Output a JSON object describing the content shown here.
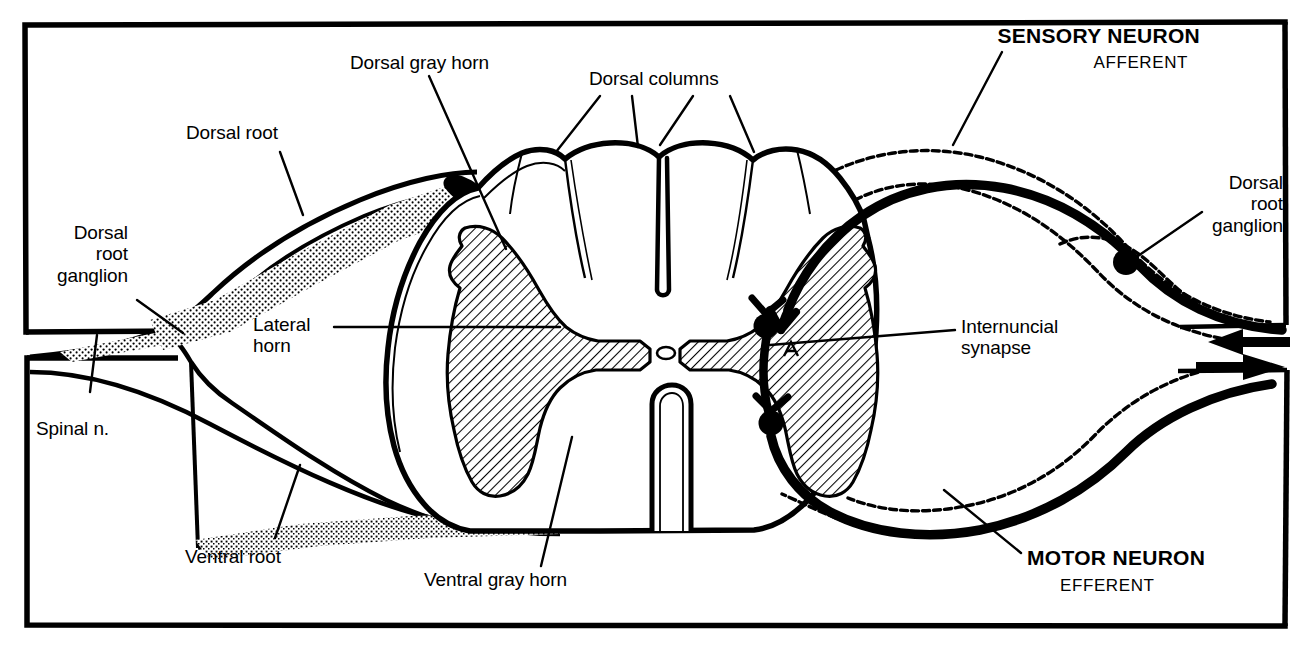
{
  "figure": {
    "ink_color": "#000000",
    "background_color": "#ffffff"
  },
  "labels": {
    "dorsal_root_ganglion_left": "Dorsal\nroot\nganglion",
    "dorsal_root": "Dorsal root",
    "dorsal_gray_horn": "Dorsal gray horn",
    "dorsal_columns": "Dorsal columns",
    "sensory_neuron": "SENSORY NEURON",
    "afferent": "AFFERENT",
    "dorsal_root_ganglion_right": "Dorsal\nroot\nganglion",
    "lateral_horn": "Lateral\nhorn",
    "internuncial_synapse": "Internuncial\nsynapse",
    "spinal_nerve": "Spinal n.",
    "ventral_root": "Ventral root",
    "ventral_gray_horn": "Ventral gray horn",
    "motor_neuron": "MOTOR NEURON",
    "efferent": "EFFERENT"
  },
  "structures": [
    {
      "name": "dorsal-root-ganglion-left",
      "side": "left",
      "type": "ganglion"
    },
    {
      "name": "dorsal-root",
      "side": "left",
      "type": "nerve-root"
    },
    {
      "name": "ventral-root",
      "side": "left",
      "type": "nerve-root"
    },
    {
      "name": "spinal-nerve",
      "side": "left",
      "type": "nerve"
    },
    {
      "name": "dorsal-gray-horn",
      "side": "center",
      "type": "gray-matter"
    },
    {
      "name": "lateral-horn",
      "side": "center",
      "type": "gray-matter"
    },
    {
      "name": "ventral-gray-horn",
      "side": "center",
      "type": "gray-matter"
    },
    {
      "name": "dorsal-columns",
      "side": "center",
      "type": "white-matter"
    },
    {
      "name": "central-canal",
      "side": "center",
      "type": "canal"
    },
    {
      "name": "dorsal-median-sulcus",
      "side": "center",
      "type": "sulcus"
    },
    {
      "name": "ventral-median-fissure",
      "side": "center",
      "type": "fissure"
    },
    {
      "name": "sensory-neuron",
      "side": "right",
      "type": "neuron"
    },
    {
      "name": "motor-neuron",
      "side": "right",
      "type": "neuron"
    },
    {
      "name": "internuncial-synapse",
      "side": "right",
      "type": "synapse"
    },
    {
      "name": "dorsal-root-ganglion-right",
      "side": "right",
      "type": "ganglion"
    },
    {
      "name": "afferent-arrow",
      "side": "right",
      "type": "direction-arrow"
    },
    {
      "name": "efferent-arrow",
      "side": "right",
      "type": "direction-arrow"
    }
  ]
}
